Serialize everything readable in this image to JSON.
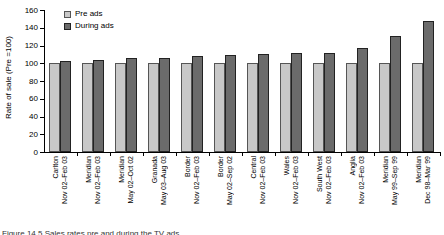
{
  "chart_data": {
    "type": "bar",
    "title": "",
    "ylabel": "Rate of sale (Pre =100)",
    "xlabel": "",
    "ylim": [
      0,
      160
    ],
    "ytick_step": 20,
    "grid": false,
    "legend_position": "top-left-inside",
    "categories": [
      {
        "region": "Carlton",
        "period": "Nov 02–Feb 03"
      },
      {
        "region": "Meridian",
        "period": "Nov 02–Feb 03"
      },
      {
        "region": "Meridian",
        "period": "May 02–Oct 02"
      },
      {
        "region": "Granada",
        "period": "May 03–Aug 03"
      },
      {
        "region": "Border",
        "period": "Nov 02–Feb 03"
      },
      {
        "region": "Border",
        "period": "May 02–Sep 02"
      },
      {
        "region": "Central",
        "period": "Nov 02–Feb 03"
      },
      {
        "region": "Wales",
        "period": "Nov 02–Feb 03"
      },
      {
        "region": "South West",
        "period": "Nov 02–Feb 03"
      },
      {
        "region": "Anglia",
        "period": "Nov 02–Feb 03"
      },
      {
        "region": "Meridian",
        "period": "May 99–Sep 99"
      },
      {
        "region": "Meridian",
        "period": "Dec 98–Mar 99"
      }
    ],
    "series": [
      {
        "name": "Pre ads",
        "values": [
          100,
          100,
          100,
          100,
          100,
          100,
          100,
          100,
          100,
          100,
          100,
          100
        ]
      },
      {
        "name": "During ads",
        "values": [
          103,
          104,
          106,
          106,
          108,
          109,
          110,
          111,
          112,
          117,
          131,
          148
        ]
      }
    ],
    "colors": {
      "pre_fill": "#c8c8c8",
      "pre_border": "#555555",
      "during_fill": "#6b6b6b",
      "during_border": "#222222",
      "axis": "#000000"
    }
  },
  "legend": {
    "items": [
      {
        "label": "Pre ads"
      },
      {
        "label": "During ads"
      }
    ]
  },
  "caption_fragment": "Figure 14.5 Sales rates pre and during the TV ads"
}
